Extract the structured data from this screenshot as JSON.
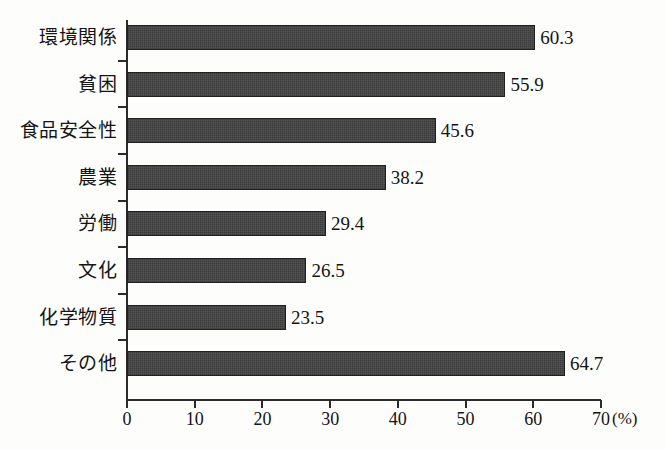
{
  "chart_data": {
    "type": "bar",
    "orientation": "horizontal",
    "title": "",
    "xlabel": "(%)",
    "ylabel": "",
    "categories": [
      "環境関係",
      "貧困",
      "食品安全性",
      "農業",
      "労働",
      "文化",
      "化学物質",
      "その他"
    ],
    "values": [
      60.3,
      55.9,
      45.6,
      38.2,
      29.4,
      26.5,
      23.5,
      64.7
    ],
    "value_labels": [
      "60.3",
      "55.9",
      "45.6",
      "38.2",
      "29.4",
      "26.5",
      "23.5",
      "64.7"
    ],
    "xlim": [
      0,
      70
    ],
    "xticks": [
      0,
      10,
      20,
      30,
      40,
      50,
      60,
      70
    ],
    "xtick_labels": [
      "0",
      "10",
      "20",
      "30",
      "40",
      "50",
      "60",
      "70"
    ],
    "grid": false,
    "legend": null,
    "bar_color": "#3b3b3b",
    "axis_color": "#2b2b2b",
    "background_color": "#fdfdfb"
  },
  "axis": {
    "unit_label": "(%)"
  }
}
